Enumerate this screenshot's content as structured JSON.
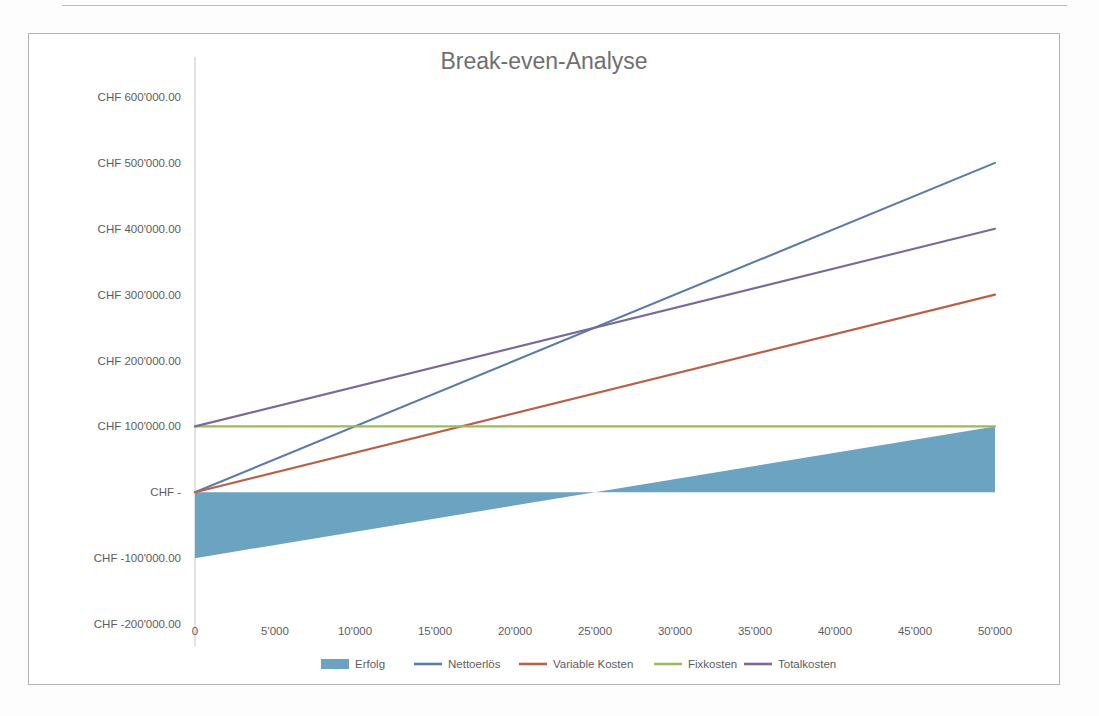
{
  "document": {
    "page_background": "#fdfdfd",
    "frame_border_color": "#b2b2b2"
  },
  "chart_data": {
    "type": "line",
    "title": "Break-even-Analyse",
    "xlabel": "",
    "ylabel": "",
    "grid": false,
    "legend_position": "bottom",
    "x": [
      0,
      50000
    ],
    "xlim": [
      0,
      52500
    ],
    "ylim": [
      -200000,
      600000
    ],
    "x_tick_values": [
      0,
      5000,
      10000,
      15000,
      20000,
      25000,
      30000,
      35000,
      40000,
      45000,
      50000
    ],
    "x_tick_labels": [
      "0",
      "5'000",
      "10'000",
      "15'000",
      "20'000",
      "25'000",
      "30'000",
      "35'000",
      "40'000",
      "45'000",
      "50'000"
    ],
    "y_tick_values": [
      600000,
      500000,
      400000,
      300000,
      200000,
      100000,
      0,
      -100000,
      -200000
    ],
    "y_tick_labels": [
      "CHF 600'000.00",
      "CHF 500'000.00",
      "CHF 400'000.00",
      "CHF 300'000.00",
      "CHF 200'000.00",
      "CHF 100'000.00",
      "CHF -",
      "CHF -100'000.00",
      "CHF -200'000.00"
    ],
    "break_even_units": 25000,
    "break_even_value": 250000,
    "series": [
      {
        "name": "Erfolg",
        "render": "area",
        "color": "#6ba3c0",
        "values": [
          -100000,
          100000
        ]
      },
      {
        "name": "Nettoerlös",
        "render": "line",
        "color": "#5b7ba8",
        "values": [
          0,
          500000
        ]
      },
      {
        "name": "Variable Kosten",
        "render": "line",
        "color": "#b8614a",
        "values": [
          0,
          300000
        ]
      },
      {
        "name": "Fixkosten",
        "render": "line",
        "color": "#9bbb59",
        "values": [
          100000,
          100000
        ]
      },
      {
        "name": "Totalkosten",
        "render": "line",
        "color": "#7a6a9a",
        "values": [
          100000,
          400000
        ]
      }
    ]
  }
}
